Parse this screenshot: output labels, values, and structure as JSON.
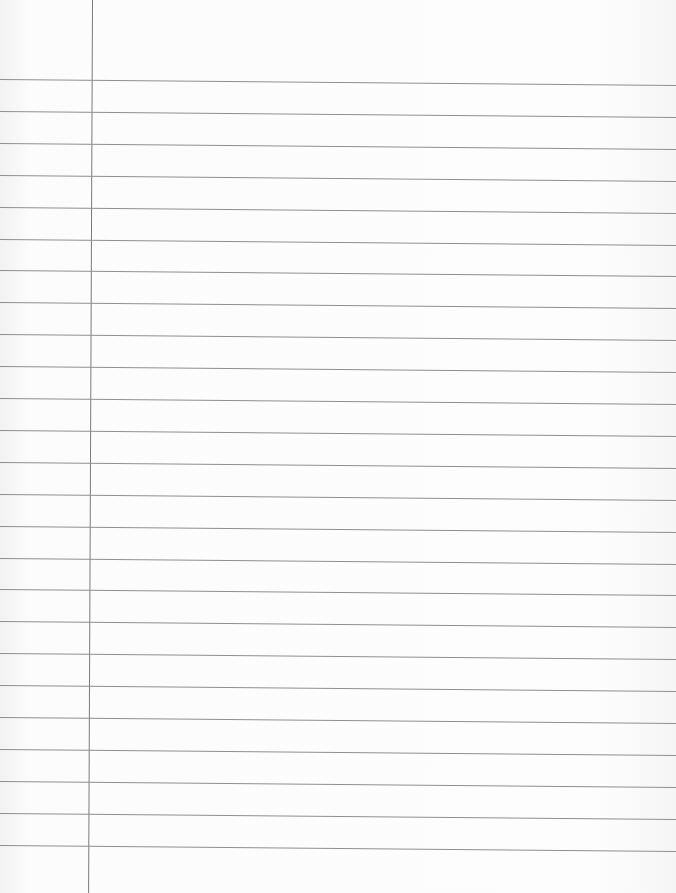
{
  "paper": {
    "type": "lined-notebook-paper",
    "background_color": "#fafafa",
    "rule_color": "#8f8f8f",
    "margin_color": "#7a7a7a",
    "margin_x": 92,
    "first_rule_y": 79,
    "rule_spacing": 31.9,
    "rule_count": 25,
    "written_content": ""
  }
}
